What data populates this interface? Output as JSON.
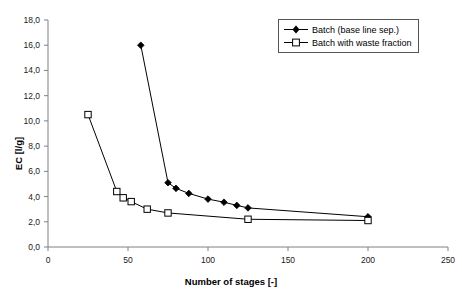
{
  "chart_data": {
    "type": "line",
    "title": "",
    "xlabel": "Number of stages [-]",
    "ylabel": "EC [l/g]",
    "xlim": [
      0,
      250
    ],
    "ylim": [
      0,
      18
    ],
    "xticks": [
      "0",
      "50",
      "100",
      "150",
      "200",
      "250"
    ],
    "xtick_values": [
      0,
      50,
      100,
      150,
      200,
      250
    ],
    "yticks": [
      "0,0",
      "2,0",
      "4,0",
      "6,0",
      "8,0",
      "10,0",
      "12,0",
      "14,0",
      "16,0",
      "18,0"
    ],
    "ytick_values": [
      0,
      2,
      4,
      6,
      8,
      10,
      12,
      14,
      16,
      18
    ],
    "grid": false,
    "legend_position": "top-right",
    "series": [
      {
        "name": "Batch (base line sep.)",
        "marker": "filled-diamond",
        "color": "#000000",
        "points": [
          {
            "x": 58,
            "y": 16.0
          },
          {
            "x": 75,
            "y": 5.1
          },
          {
            "x": 80,
            "y": 4.65
          },
          {
            "x": 88,
            "y": 4.25
          },
          {
            "x": 100,
            "y": 3.8
          },
          {
            "x": 110,
            "y": 3.55
          },
          {
            "x": 118,
            "y": 3.3
          },
          {
            "x": 125,
            "y": 3.1
          },
          {
            "x": 200,
            "y": 2.4
          }
        ]
      },
      {
        "name": "Batch with waste fraction",
        "marker": "open-square",
        "color": "#000000",
        "points": [
          {
            "x": 25,
            "y": 10.5
          },
          {
            "x": 43,
            "y": 4.4
          },
          {
            "x": 47,
            "y": 3.9
          },
          {
            "x": 52,
            "y": 3.6
          },
          {
            "x": 62,
            "y": 3.0
          },
          {
            "x": 75,
            "y": 2.7
          },
          {
            "x": 125,
            "y": 2.2
          },
          {
            "x": 200,
            "y": 2.1
          }
        ]
      }
    ]
  },
  "legend": {
    "items": [
      {
        "label": "Batch (base line sep.)",
        "marker": "filled-diamond"
      },
      {
        "label": "Batch with waste fraction",
        "marker": "open-square"
      }
    ]
  }
}
